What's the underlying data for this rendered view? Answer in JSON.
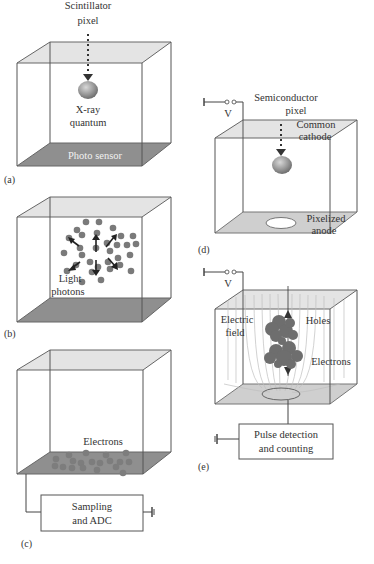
{
  "figure": {
    "panels": [
      {
        "id": "a",
        "label": "(a)",
        "title_line1": "Scintillator",
        "title_line2": "pixel",
        "quantum_line1": "X-ray",
        "quantum_line2": "quantum",
        "bottom_label": "Photo sensor"
      },
      {
        "id": "b",
        "label": "(b)",
        "photons_line1": "Light",
        "photons_line2": "photons"
      },
      {
        "id": "c",
        "label": "(c)",
        "electrons_label": "Electrons",
        "box_line1": "Sampling",
        "box_line2": "and ADC"
      },
      {
        "id": "d",
        "label": "(d)",
        "voltage_label": "V",
        "title_line1": "Semiconductor",
        "title_line2": "pixel",
        "cathode_line1": "Common",
        "cathode_line2": "cathode",
        "anode_line1": "Pixelized",
        "anode_line2": "anode"
      },
      {
        "id": "e",
        "label": "(e)",
        "voltage_label": "V",
        "field_line1": "Electric",
        "field_line2": "field",
        "holes_label": "Holes",
        "electrons_label": "Electrons",
        "box_line1": "Pulse detection",
        "box_line2": "and counting"
      }
    ]
  },
  "colors": {
    "top_face": "#e4e4e4",
    "scintillator_bottom": "#8f8f8f",
    "semiconductor_bottom": "#cfcfcf",
    "particles": "#7a7a7a"
  }
}
